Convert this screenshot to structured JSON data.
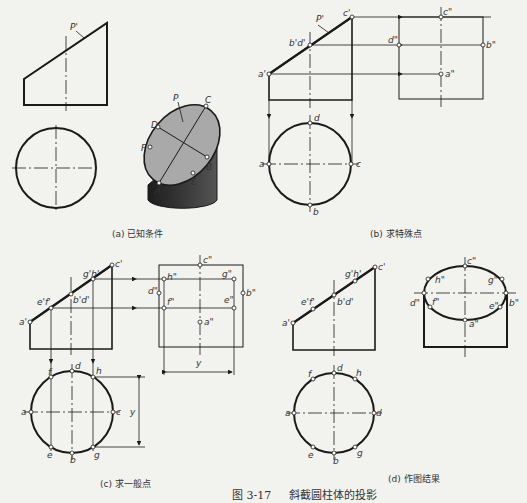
{
  "figure": {
    "number": "图 3-17",
    "title": "斜截圆柱体的投影"
  },
  "panels": [
    {
      "id": "a",
      "caption": "(a) 已知条件",
      "labels": {
        "plane_front": "P'",
        "plane_3d": "P",
        "points_3d": [
          "C",
          "D",
          "F",
          "B",
          "A",
          "E"
        ]
      }
    },
    {
      "id": "b",
      "caption": "(b) 求特殊点",
      "labels": {
        "plane_front": "P'",
        "front": [
          "a'",
          "b'd'",
          "c'"
        ],
        "side": [
          "c\"",
          "d\"",
          "b\"",
          "a\""
        ],
        "top": [
          "d",
          "a",
          "c",
          "b"
        ]
      }
    },
    {
      "id": "c",
      "caption": "(c) 求一般点",
      "labels": {
        "front": [
          "a'",
          "e'f'",
          "b'd'",
          "g'h'",
          "c'"
        ],
        "side": [
          "c\"",
          "h\"",
          "g\"",
          "d\"",
          "b\"",
          "f\"",
          "e\"",
          "a\""
        ],
        "top": [
          "f",
          "d",
          "h",
          "a",
          "c",
          "e",
          "b",
          "g"
        ],
        "dimension": "y"
      }
    },
    {
      "id": "d",
      "caption": "(d) 作图结果",
      "labels": {
        "front": [
          "a'",
          "e'f'",
          "b'd'",
          "g'h'",
          "c'"
        ],
        "side": [
          "c\"",
          "h\"",
          "g\"",
          "d\"",
          "b\"",
          "f\"",
          "e\"",
          "a\""
        ],
        "top": [
          "f",
          "d",
          "h",
          "a",
          "d",
          "e",
          "b",
          "g"
        ]
      }
    }
  ],
  "colors": {
    "line": "#1a1a1a",
    "section_fill": "#a9a9a9",
    "cylinder_dark": "#2b2b2b",
    "paper": "#f2f2ef"
  }
}
